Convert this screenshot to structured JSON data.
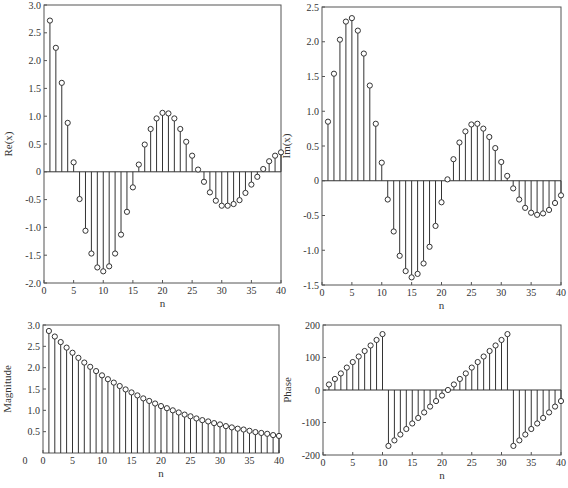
{
  "chart_data": [
    {
      "type": "stem",
      "title": "",
      "xlabel": "n",
      "ylabel": "Re(x)",
      "xlim": [
        0,
        40
      ],
      "ylim": [
        -2.0,
        3.0
      ],
      "xticks": [
        0,
        5,
        10,
        15,
        20,
        25,
        30,
        35,
        40
      ],
      "yticks": [
        -2.0,
        -1.5,
        -1.0,
        -0.5,
        0,
        0.5,
        1.0,
        1.5,
        2.0,
        2.5,
        3.0
      ],
      "ytick_labels": [
        "-2.0",
        "-1.5",
        "-1.0",
        "-0.5",
        "0",
        "0.5",
        "1.0",
        "1.5",
        "2.0",
        "2.5",
        "3.0"
      ],
      "x": [
        1,
        2,
        3,
        4,
        5,
        6,
        7,
        8,
        9,
        10,
        11,
        12,
        13,
        14,
        15,
        16,
        17,
        18,
        19,
        20,
        21,
        22,
        23,
        24,
        25,
        26,
        27,
        28,
        29,
        30,
        31,
        32,
        33,
        34,
        35,
        36,
        37,
        38,
        39,
        40
      ],
      "values": [
        2.72,
        2.23,
        1.6,
        0.88,
        0.17,
        -0.49,
        -1.06,
        -1.47,
        -1.72,
        -1.79,
        -1.7,
        -1.47,
        -1.13,
        -0.72,
        -0.28,
        0.13,
        0.49,
        0.77,
        0.96,
        1.06,
        1.05,
        0.96,
        0.77,
        0.54,
        0.29,
        0.04,
        -0.18,
        -0.37,
        -0.52,
        -0.61,
        -0.61,
        -0.58,
        -0.51,
        -0.38,
        -0.23,
        -0.09,
        0.05,
        0.19,
        0.29,
        0.35
      ],
      "grid": false
    },
    {
      "type": "stem",
      "title": "",
      "xlabel": "n",
      "ylabel": "Im(x)",
      "xlim": [
        0,
        40
      ],
      "ylim": [
        -1.5,
        2.5
      ],
      "xticks": [
        0,
        5,
        10,
        15,
        20,
        25,
        30,
        35,
        40
      ],
      "yticks": [
        -1.5,
        -1.0,
        -0.5,
        0,
        0.5,
        1.0,
        1.5,
        2.0,
        2.5
      ],
      "ytick_labels": [
        "-1.5",
        "-1.0",
        "-0.5",
        "0",
        "0.5",
        "1.0",
        "1.5",
        "2.0",
        "2.5"
      ],
      "x": [
        1,
        2,
        3,
        4,
        5,
        6,
        7,
        8,
        9,
        10,
        11,
        12,
        13,
        14,
        15,
        16,
        17,
        18,
        19,
        20,
        21,
        22,
        23,
        24,
        25,
        26,
        27,
        28,
        29,
        30,
        31,
        32,
        33,
        34,
        35,
        36,
        37,
        38,
        39,
        40
      ],
      "values": [
        0.85,
        1.54,
        2.03,
        2.29,
        2.34,
        2.16,
        1.83,
        1.37,
        0.82,
        0.26,
        -0.27,
        -0.73,
        -1.08,
        -1.3,
        -1.39,
        -1.34,
        -1.19,
        -0.95,
        -0.65,
        -0.31,
        0.02,
        0.31,
        0.55,
        0.71,
        0.81,
        0.82,
        0.75,
        0.63,
        0.47,
        0.27,
        0.07,
        -0.11,
        -0.27,
        -0.39,
        -0.46,
        -0.49,
        -0.47,
        -0.42,
        -0.32,
        -0.21
      ],
      "grid": false
    },
    {
      "type": "stem",
      "title": "",
      "xlabel": "n",
      "ylabel": "Magnitude",
      "xlim": [
        0,
        40
      ],
      "ylim": [
        0,
        3.0
      ],
      "xticks": [
        0,
        5,
        10,
        15,
        20,
        25,
        30,
        35,
        40
      ],
      "yticks": [
        0.5,
        1.0,
        1.5,
        2.0,
        2.5,
        3.0
      ],
      "ytick_labels": [
        "0.5",
        "1.0",
        "1.5",
        "2.0",
        "2.5",
        "3.0"
      ],
      "x": [
        1,
        2,
        3,
        4,
        5,
        6,
        7,
        8,
        9,
        10,
        11,
        12,
        13,
        14,
        15,
        16,
        17,
        18,
        19,
        20,
        21,
        22,
        23,
        24,
        25,
        26,
        27,
        28,
        29,
        30,
        31,
        32,
        33,
        34,
        35,
        36,
        37,
        38,
        39,
        40
      ],
      "values": [
        2.86,
        2.73,
        2.6,
        2.47,
        2.35,
        2.23,
        2.12,
        2.02,
        1.92,
        1.82,
        1.73,
        1.65,
        1.57,
        1.49,
        1.42,
        1.35,
        1.28,
        1.22,
        1.16,
        1.1,
        1.05,
        1.0,
        0.95,
        0.9,
        0.86,
        0.81,
        0.77,
        0.74,
        0.7,
        0.67,
        0.63,
        0.6,
        0.57,
        0.55,
        0.52,
        0.49,
        0.47,
        0.45,
        0.42,
        0.4
      ],
      "grid": false
    },
    {
      "type": "stem",
      "title": "",
      "xlabel": "n",
      "ylabel": "Phase",
      "xlim": [
        0,
        40
      ],
      "ylim": [
        -200,
        200
      ],
      "xticks": [
        0,
        5,
        10,
        15,
        20,
        25,
        30,
        35,
        40
      ],
      "yticks": [
        -200,
        -100,
        0,
        100,
        200
      ],
      "ytick_labels": [
        "-200",
        "-100",
        "0",
        "100",
        "200"
      ],
      "x": [
        1,
        2,
        3,
        4,
        5,
        6,
        7,
        8,
        9,
        10,
        11,
        12,
        13,
        14,
        15,
        16,
        17,
        18,
        19,
        20,
        21,
        22,
        23,
        24,
        25,
        26,
        27,
        28,
        29,
        30,
        31,
        32,
        33,
        34,
        35,
        36,
        37,
        38,
        39,
        40
      ],
      "values": [
        17,
        34,
        51,
        69,
        86,
        103,
        120,
        137,
        154,
        172,
        -172,
        -155,
        -137,
        -120,
        -103,
        -86,
        -69,
        -51,
        -34,
        -17,
        0,
        17,
        34,
        51,
        69,
        86,
        103,
        120,
        137,
        154,
        172,
        -172,
        -155,
        -137,
        -120,
        -103,
        -86,
        -69,
        -51,
        -34
      ],
      "grid": false
    }
  ],
  "layout": {
    "panels": [
      {
        "left": 44,
        "top": 5,
        "right": 281,
        "bottom": 283
      },
      {
        "left": 322,
        "top": 7,
        "right": 561,
        "bottom": 285
      },
      {
        "left": 43,
        "top": 325,
        "right": 279,
        "bottom": 453
      },
      {
        "left": 323,
        "top": 325,
        "right": 561,
        "bottom": 455
      }
    ]
  }
}
